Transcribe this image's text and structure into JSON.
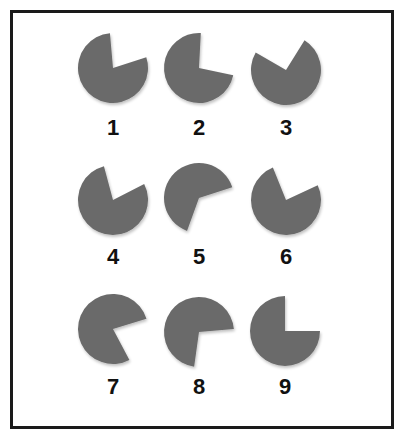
{
  "figure": {
    "fill_color": "#6b6b6b",
    "border_color": "#1a1a1a",
    "radius": 35,
    "items": [
      {
        "label": "1",
        "cx": 113,
        "cy": 68,
        "gap_start_deg": -95,
        "gap_end_deg": -18
      },
      {
        "label": "2",
        "cx": 199,
        "cy": 68,
        "gap_start_deg": -87,
        "gap_end_deg": 12
      },
      {
        "label": "3",
        "cx": 286,
        "cy": 70,
        "gap_start_deg": -150,
        "gap_end_deg": -58
      },
      {
        "label": "4",
        "cx": 113,
        "cy": 200,
        "gap_start_deg": -105,
        "gap_end_deg": -27
      },
      {
        "label": "5",
        "cx": 199,
        "cy": 198,
        "gap_start_deg": -18,
        "gap_end_deg": 110
      },
      {
        "label": "6",
        "cx": 286,
        "cy": 200,
        "gap_start_deg": -112,
        "gap_end_deg": -25
      },
      {
        "label": "7",
        "cx": 113,
        "cy": 329,
        "gap_start_deg": -17,
        "gap_end_deg": 62
      },
      {
        "label": "8",
        "cx": 199,
        "cy": 332,
        "gap_start_deg": -5,
        "gap_end_deg": 98
      },
      {
        "label": "9",
        "cx": 285,
        "cy": 331,
        "gap_start_deg": -90,
        "gap_end_deg": 0
      }
    ],
    "label_y": [
      117,
      246,
      376
    ]
  }
}
